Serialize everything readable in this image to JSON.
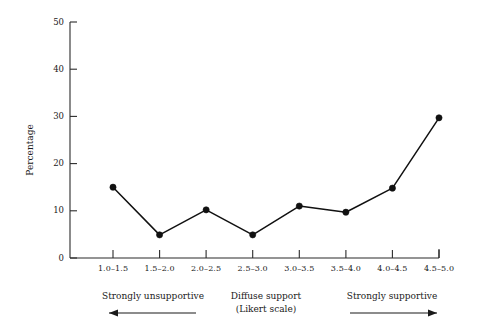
{
  "figure": {
    "background": "#ffffff",
    "ink_color": "#111111"
  },
  "chart_data": {
    "type": "line",
    "title": "",
    "xlabel": "",
    "ylabel": "Percentage",
    "ylim": [
      0,
      50
    ],
    "ytick_values": [
      0,
      10,
      20,
      30,
      40,
      50
    ],
    "ytick_labels": [
      "0",
      "10",
      "20",
      "30",
      "40",
      "50"
    ],
    "grid": false,
    "legend": "none",
    "categories": [
      "1.0–1.5",
      "1.5–2.0",
      "2.0–2.5",
      "2.5–3.0",
      "3.0–3.5",
      "3.5–4.0",
      "4.0–4.5",
      "4.5–5.0"
    ],
    "values": [
      15.0,
      4.9,
      10.2,
      4.9,
      11.0,
      9.7,
      14.8,
      29.7
    ],
    "marker": "filled-circle",
    "line_color": "#111111"
  },
  "annotations": {
    "left": {
      "label": "Strongly unsupportive",
      "arrow_direction": "left",
      "arrow_icon": "arrow-left-icon"
    },
    "center": {
      "line1": "Diffuse support",
      "line2": "(Likert scale)"
    },
    "right": {
      "label": "Strongly supportive",
      "arrow_direction": "right",
      "arrow_icon": "arrow-right-icon"
    }
  }
}
